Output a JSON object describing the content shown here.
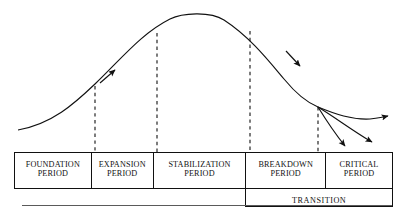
{
  "diagram": {
    "type": "annotated-curve-with-phase-table",
    "colors": {
      "curve": "#111111",
      "dashed_divider": "#111111",
      "table_border": "#111111",
      "text": "#111111",
      "baseline_rule": "#5a5a5a",
      "background": "#ffffff"
    }
  },
  "phases": [
    {
      "id": "foundation",
      "line1": "FOUNDATION",
      "line2": "PERIOD",
      "width_pct": 20.3
    },
    {
      "id": "expansion",
      "line1": "EXPANSION",
      "line2": "PERIOD",
      "width_pct": 16.4
    },
    {
      "id": "stabilization",
      "line1": "STABILIZATION",
      "line2": "PERIOD",
      "width_pct": 24.5
    },
    {
      "id": "breakdown",
      "line1": "BREAKDOWN",
      "line2": "PERIOD",
      "width_pct": 21.1
    },
    {
      "id": "critical",
      "line1": "CRITICAL",
      "line2": "PERIOD",
      "width_pct": 17.7
    }
  ],
  "transition": {
    "label": "TRANSITION",
    "spans_phases": [
      "breakdown",
      "critical"
    ]
  },
  "curve": {
    "shape": "bell",
    "start_point": [
      18,
      130
    ],
    "peak_point": [
      196,
      12
    ],
    "branch_point": [
      318,
      107
    ],
    "dashed_dividers_x": [
      95,
      157,
      250,
      318
    ],
    "arrowheads": [
      {
        "name": "ascending-arrow",
        "x": 112,
        "y": 73,
        "direction": "up-right"
      },
      {
        "name": "descending-arrow",
        "x": 297,
        "y": 63,
        "direction": "down-right"
      }
    ],
    "branches": [
      {
        "name": "recovery-branch",
        "end": [
          394,
          117
        ],
        "direction": "right-up"
      },
      {
        "name": "decline-branch",
        "end": [
          389,
          147
        ],
        "direction": "right-down"
      },
      {
        "name": "collapse-branch",
        "end": [
          352,
          152
        ],
        "direction": "down-right-steep"
      }
    ]
  }
}
